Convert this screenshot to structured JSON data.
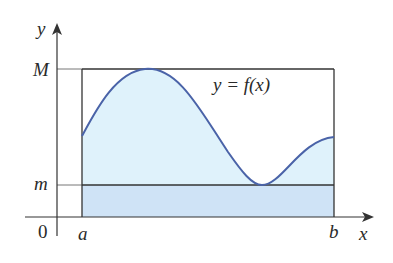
{
  "figure": {
    "type": "mean-value / area bounds diagram",
    "axes": {
      "x_label": "x",
      "y_label": "y",
      "origin_label": "0"
    },
    "interval": {
      "left_label": "a",
      "right_label": "b"
    },
    "bounds": {
      "upper_label": "M",
      "lower_label": "m"
    },
    "curve": {
      "label": "y = f(x)"
    },
    "colors": {
      "curve": "#4a63a8",
      "area_under_curve": "#dff2fb",
      "lower_rectangle": "#cfe3f6",
      "lines": "#333333"
    }
  }
}
